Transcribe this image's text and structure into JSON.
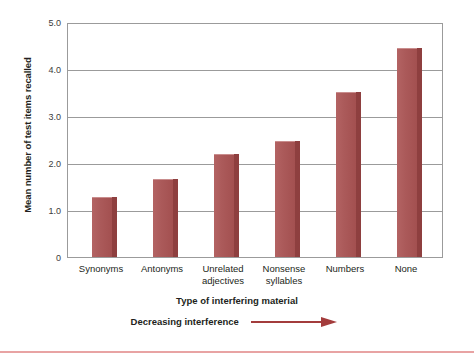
{
  "chart_data": {
    "type": "bar",
    "title": "",
    "categories": [
      "Synonyms",
      "Antonyms",
      "Unrelated adjectives",
      "Nonsense syllables",
      "Numbers",
      "None"
    ],
    "category_lines": [
      [
        "Synonyms"
      ],
      [
        "Antonyms"
      ],
      [
        "Unrelated",
        "adjectives"
      ],
      [
        "Nonsense",
        "syllables"
      ],
      [
        "Numbers"
      ],
      [
        "None"
      ]
    ],
    "values": [
      1.28,
      1.67,
      2.2,
      2.47,
      3.52,
      4.45
    ],
    "xlabel": "Type of interfering material",
    "ylabel": "Mean number of test items recalled",
    "ylim": [
      0,
      5.0
    ],
    "yticks": [
      "0",
      "1.0",
      "2.0",
      "3.0",
      "4.0",
      "5.0"
    ],
    "ytick_values": [
      0,
      1.0,
      2.0,
      3.0,
      4.0,
      5.0
    ],
    "grid": true,
    "legend": "none",
    "annotation": "Decreasing interference",
    "annotation_arrow": "right-arrow",
    "bar_color": "#a85353",
    "bar_side_color": "#8e3f3f",
    "grid_color": "#9b9b9b",
    "text_color": "#231f20",
    "accent_rule_color": "#e8a3a3"
  }
}
